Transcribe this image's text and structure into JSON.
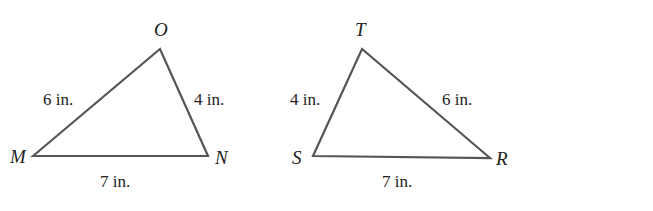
{
  "triangles": [
    {
      "name": "MNO",
      "vertices": {
        "M": {
          "label": "M",
          "x": 33,
          "y": 156
        },
        "O": {
          "label": "O",
          "x": 160,
          "y": 49
        },
        "N": {
          "label": "N",
          "x": 208,
          "y": 156
        }
      },
      "sides": {
        "MO": "6 in.",
        "ON": "4 in.",
        "MN": "7 in."
      }
    },
    {
      "name": "RST",
      "vertices": {
        "S": {
          "label": "S",
          "x": 313,
          "y": 156
        },
        "T": {
          "label": "T",
          "x": 362,
          "y": 49
        },
        "R": {
          "label": "R",
          "x": 490,
          "y": 158
        }
      },
      "sides": {
        "ST": "4 in.",
        "TR": "6 in.",
        "SR": "7 in."
      }
    }
  ],
  "congruences": [
    {
      "left": "MO",
      "symbol": "≅",
      "right": "RT"
    },
    {
      "left": "MN",
      "symbol": "≅",
      "right": "RS"
    },
    {
      "left": "NO",
      "symbol": "≅",
      "right": "ST"
    }
  ],
  "colors": {
    "line": "#555555",
    "text": "#222222",
    "background": "#ffffff"
  }
}
